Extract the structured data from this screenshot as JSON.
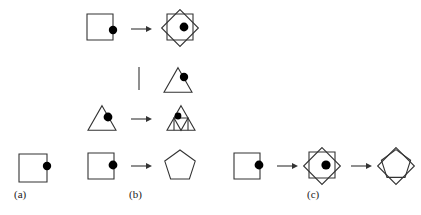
{
  "figure": {
    "type": "diagram",
    "stroke_color": "#333333",
    "dot_color": "#000000",
    "background_color": "#ffffff",
    "stroke_width": 1.1,
    "panels": [
      {
        "id": "a",
        "label": "(a)",
        "label_x": 14,
        "label_y": 189,
        "items": [
          {
            "kind": "shape",
            "shape": "square",
            "cx": 33,
            "cy": 168,
            "size": 28,
            "dot": {
              "x": 47,
              "y": 166,
              "r": 4.2
            }
          }
        ]
      },
      {
        "id": "b",
        "label": "(b)",
        "label_x": 129,
        "label_y": 189,
        "rows": [
          {
            "row": "top",
            "items": [
              {
                "kind": "shape",
                "shape": "square",
                "cx": 100,
                "cy": 27,
                "size": 26,
                "dot": {
                  "x": 113,
                  "y": 30,
                  "r": 4.2
                }
              },
              {
                "kind": "arrow",
                "x1": 131,
                "y1": 29,
                "x2": 152,
                "y2": 29
              },
              {
                "kind": "shape",
                "shape": "diamond-square",
                "cx": 180,
                "cy": 28,
                "size": 26,
                "dot": {
                  "x": 184,
                  "y": 27,
                  "r": 4.4
                }
              }
            ]
          },
          {
            "row": "middle-divider",
            "items": [
              {
                "kind": "divider",
                "x1": 139,
                "y1": 67,
                "x2": 139,
                "y2": 90
              },
              {
                "kind": "shape",
                "shape": "triangle",
                "cx": 178,
                "cy": 80,
                "size": 28,
                "dot": {
                  "x": 184,
                  "y": 77,
                  "r": 4.2
                }
              }
            ]
          },
          {
            "row": "triangle-rule",
            "items": [
              {
                "kind": "shape",
                "shape": "triangle",
                "cx": 102,
                "cy": 118,
                "size": 28,
                "dot": {
                  "x": 108,
                  "y": 117,
                  "r": 4.4
                }
              },
              {
                "kind": "arrow",
                "x1": 131,
                "y1": 119,
                "x2": 152,
                "y2": 119
              },
              {
                "kind": "shape",
                "shape": "triangle-nested",
                "cx": 181,
                "cy": 118,
                "size": 28,
                "dot": {
                  "x": 178,
                  "y": 116,
                  "r": 3.4
                }
              }
            ]
          },
          {
            "row": "bottom",
            "items": [
              {
                "kind": "shape",
                "shape": "square",
                "cx": 101,
                "cy": 166,
                "size": 26,
                "dot": {
                  "x": 113,
                  "y": 165,
                  "r": 4.4
                }
              },
              {
                "kind": "arrow",
                "x1": 131,
                "y1": 166,
                "x2": 152,
                "y2": 166
              },
              {
                "kind": "shape",
                "shape": "pentagon",
                "cx": 180,
                "cy": 166,
                "size": 32,
                "dot": null
              }
            ]
          }
        ]
      },
      {
        "id": "c",
        "label": "(c)",
        "label_x": 307,
        "label_y": 189,
        "items": [
          {
            "kind": "shape",
            "shape": "square",
            "cx": 247,
            "cy": 166,
            "size": 26,
            "dot": {
              "x": 259,
              "y": 165,
              "r": 4.4
            }
          },
          {
            "kind": "arrow",
            "x1": 277,
            "y1": 166,
            "x2": 298,
            "y2": 166
          },
          {
            "kind": "shape",
            "shape": "diamond-square",
            "cx": 322,
            "cy": 166,
            "size": 26,
            "dot": {
              "x": 326,
              "y": 165,
              "r": 4.6
            }
          },
          {
            "kind": "arrow",
            "x1": 351,
            "y1": 166,
            "x2": 372,
            "y2": 166
          },
          {
            "kind": "shape",
            "shape": "diamond-pentagon",
            "cx": 396,
            "cy": 166,
            "size": 26,
            "dot": null
          }
        ]
      }
    ]
  },
  "labels": {
    "a": "(a)",
    "b": "(b)",
    "c": "(c)"
  }
}
